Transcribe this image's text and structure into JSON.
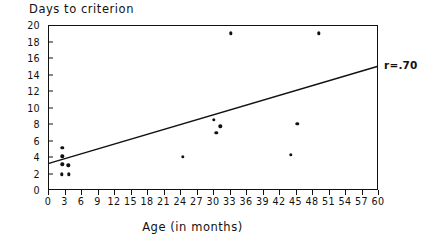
{
  "chart_data": {
    "type": "scatter",
    "title": "",
    "xlabel": "Age (in months)",
    "ylabel": "Days to criterion",
    "xlim": [
      0,
      60
    ],
    "ylim": [
      0,
      20
    ],
    "xticks": [
      0,
      3,
      6,
      9,
      12,
      15,
      18,
      21,
      24,
      27,
      30,
      33,
      36,
      39,
      42,
      45,
      48,
      51,
      54,
      57,
      60
    ],
    "yticks": [
      0,
      2,
      4,
      6,
      8,
      10,
      12,
      14,
      16,
      18,
      20
    ],
    "grid": false,
    "legend": null,
    "points": [
      {
        "x": 2.6,
        "y": 5.1
      },
      {
        "x": 2.6,
        "y": 4.1
      },
      {
        "x": 2.6,
        "y": 3.1
      },
      {
        "x": 3.7,
        "y": 3.0
      },
      {
        "x": 2.5,
        "y": 1.9
      },
      {
        "x": 3.8,
        "y": 1.9
      },
      {
        "x": 24.5,
        "y": 4.0
      },
      {
        "x": 30.2,
        "y": 8.5
      },
      {
        "x": 31.3,
        "y": 7.7
      },
      {
        "x": 30.6,
        "y": 6.9
      },
      {
        "x": 33.2,
        "y": 19.0
      },
      {
        "x": 44.2,
        "y": 4.3
      },
      {
        "x": 45.3,
        "y": 8.0
      },
      {
        "x": 49.2,
        "y": 19.0
      }
    ],
    "trendline": {
      "label": "r=.70",
      "x_start": 0,
      "y_start": 3.2,
      "x_end": 60,
      "y_end": 15.0
    }
  }
}
